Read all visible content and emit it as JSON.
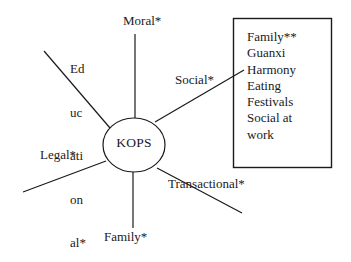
{
  "diagram": {
    "type": "hub-and-spoke",
    "hub": {
      "label": "KOPS",
      "shape": "ellipse"
    },
    "spokes": [
      {
        "id": "moral",
        "label": "Moral*",
        "direction": "top"
      },
      {
        "id": "educational",
        "label": "Educational*",
        "direction": "upper-left",
        "label_lines": [
          "Ed",
          "uc",
          "ati",
          "on",
          "al*"
        ]
      },
      {
        "id": "social",
        "label": "Social*",
        "direction": "upper-right"
      },
      {
        "id": "legal",
        "label": "Legal*",
        "direction": "lower-left"
      },
      {
        "id": "transactional",
        "label": "Transactional*",
        "direction": "lower-right"
      },
      {
        "id": "family",
        "label": "Family*",
        "direction": "bottom"
      }
    ],
    "detail_box": {
      "connected_to": "social",
      "items": [
        "Family**",
        "Guanxi",
        "Harmony",
        "Eating",
        "Festivals",
        "Social at",
        "work"
      ]
    },
    "colors": {
      "background": "#ffffff",
      "stroke": "#1a1a1a",
      "text": "#1a1a1a"
    }
  }
}
